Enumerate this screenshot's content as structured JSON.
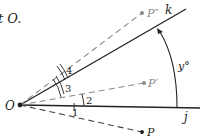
{
  "caption_fragment": "t O.",
  "origin": {
    "label": "O"
  },
  "rays": [
    {
      "id": "k",
      "label": "k",
      "style": "solid"
    },
    {
      "id": "j",
      "label": "j",
      "style": "solid"
    },
    {
      "id": "P2",
      "label": "P″",
      "style": "dashed"
    },
    {
      "id": "P1",
      "label": "P′",
      "style": "dashed"
    },
    {
      "id": "P",
      "label": "P",
      "style": "dashed"
    }
  ],
  "angles": [
    {
      "label": "1"
    },
    {
      "label": "2"
    },
    {
      "label": "3"
    },
    {
      "label": "4"
    }
  ],
  "rotation": {
    "label": "y°"
  },
  "colors": {
    "solid": "#222222",
    "dashed": "#8a8a8a"
  }
}
